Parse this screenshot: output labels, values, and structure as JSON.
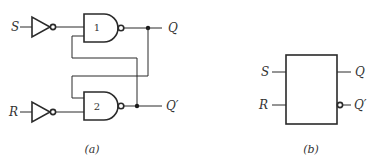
{
  "figure_a": {
    "caption": "(a)",
    "inputs": {
      "set": "S",
      "reset": "R"
    },
    "outputs": {
      "q": "Q",
      "q_not": "Q′"
    },
    "gates": [
      {
        "id": "1",
        "type": "NAND"
      },
      {
        "id": "2",
        "type": "NAND"
      }
    ],
    "inverters": [
      "S-inverter",
      "R-inverter"
    ]
  },
  "figure_b": {
    "caption": "(b)",
    "inputs": {
      "set": "S",
      "reset": "R"
    },
    "outputs": {
      "q": "Q",
      "q_not": "Q′"
    }
  }
}
